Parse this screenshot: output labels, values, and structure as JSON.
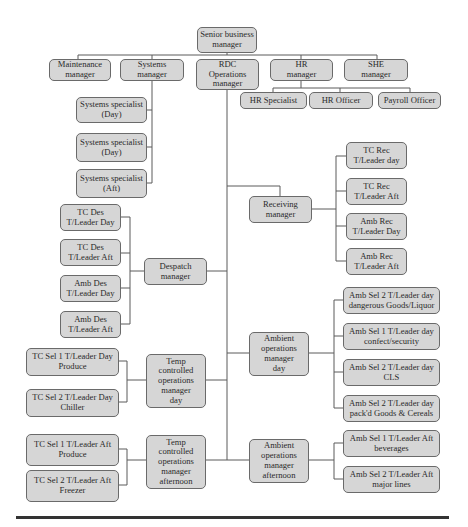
{
  "chart": {
    "type": "org_chart",
    "root": {
      "id": "senior",
      "label": "Senior business\nmanager"
    },
    "top_level": [
      {
        "id": "maint",
        "label": "Maintenance\nmanager"
      },
      {
        "id": "systems",
        "label": "Systems\nmanager"
      },
      {
        "id": "rdc",
        "label": "RDC\nOperations\nmanager"
      },
      {
        "id": "hr",
        "label": "HR\nmanager"
      },
      {
        "id": "she",
        "label": "SHE\nmanager"
      }
    ],
    "hr_reports": [
      {
        "id": "hr_spec",
        "label": "HR Specialist"
      },
      {
        "id": "hr_off",
        "label": "HR Officer"
      },
      {
        "id": "payroll",
        "label": "Payroll Officer"
      }
    ],
    "systems_reports": [
      {
        "id": "ss1",
        "label": "Systems specialist\n(Day)"
      },
      {
        "id": "ss2",
        "label": "Systems specialist\n(Day)"
      },
      {
        "id": "ss3",
        "label": "Systems specialist\n(Aft)"
      }
    ],
    "rdc_reports": {
      "receiving": {
        "label": "Receiving\nmanager",
        "children": [
          {
            "label": "TC Rec\nT/Leader day"
          },
          {
            "label": "TC Rec\nT/Leader Aft"
          },
          {
            "label": "Amb Rec\nT/Leader Day"
          },
          {
            "label": "Amb Rec\nT/Leader Aft"
          }
        ]
      },
      "despatch": {
        "label": "Despatch\nmanager",
        "children": [
          {
            "label": "TC Des\nT/Leader Day"
          },
          {
            "label": "TC Des\nT/Leader Aft"
          },
          {
            "label": "Amb Des\nT/Leader Day"
          },
          {
            "label": "Amb Des\nT/Leader Aft"
          }
        ]
      },
      "ambient_day": {
        "label": "Ambient\noperations\nmanager\nday",
        "children": [
          {
            "label": "Amb Sel 2 T/Leader day\ndangerous Goods/Liquor"
          },
          {
            "label": "Amb Sel 1 T/Leader day\nconfect/security"
          },
          {
            "label": "Amb Sel 2 T/Leader day\nCLS"
          },
          {
            "label": "Amb Sel 2 T/Leader day\npack'd Goods & Cereals"
          }
        ]
      },
      "temp_day": {
        "label": "Temp\ncontrolled\noperations\nmanager\nday",
        "children": [
          {
            "label": "TC Sel 1 T/Leader Day\nProduce"
          },
          {
            "label": "TC Sel 2 T/Leader Day\nChiller"
          }
        ]
      },
      "temp_aft": {
        "label": "Temp\ncontrolled\noperations\nmanager\nafternoon",
        "children": [
          {
            "label": "TC Sel 1 T/Leader Aft\nProduce"
          },
          {
            "label": "TC Sel 2 T/Leader Aft\nFreezer"
          }
        ]
      },
      "ambient_aft": {
        "label": "Ambient\noperations\nmanager\nafternoon",
        "children": [
          {
            "label": "Amb Sel 1 T/Leader Aft\nbeverages"
          },
          {
            "label": "Amb Sel 2 T/Leader Aft\nmajor lines"
          }
        ]
      }
    },
    "colors": {
      "box_fill": "#d6d6d6",
      "box_border": "#6a6a6a",
      "line": "#5a5a5a"
    }
  }
}
